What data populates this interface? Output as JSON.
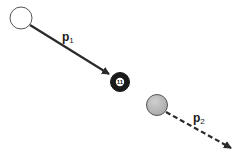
{
  "diagram": {
    "cue_ball": {
      "fill": "#ffffff",
      "stroke": "#555555"
    },
    "target_ball": {
      "number": "11",
      "fill": "#1a1a1a"
    },
    "moving_ball": {
      "fill": "#b5b5b5",
      "stroke": "#555555"
    },
    "arrows": [
      {
        "name": "p1",
        "style": "solid",
        "color": "#2b2b2b"
      },
      {
        "name": "p2",
        "style": "dashed",
        "color": "#2b2b2b"
      }
    ],
    "labels": {
      "p1": {
        "main": "p",
        "sub": "1"
      },
      "p2": {
        "main": "p",
        "sub": "2"
      }
    }
  }
}
